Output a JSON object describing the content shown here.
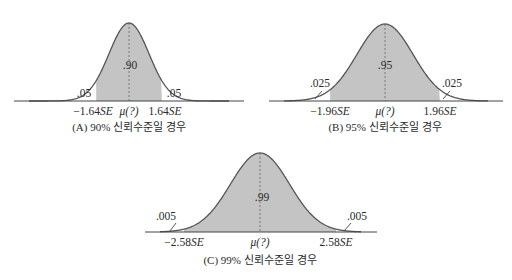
{
  "panels": [
    {
      "id": "A",
      "caption": "(A) 90% 신뢰수준일 경우",
      "center_label": ".90",
      "tail_left_label": ".05",
      "tail_right_label": ".05",
      "tick_left": "−1.64",
      "tick_center": "μ(?)",
      "tick_right": "1.64",
      "se_suffix": "SE",
      "z": 1.64,
      "confidence": 0.9,
      "tail_prob": 0.05
    },
    {
      "id": "B",
      "caption": "(B) 95% 신뢰수준일 경우",
      "center_label": ".95",
      "tail_left_label": ".025",
      "tail_right_label": ".025",
      "tick_left": "−1.96",
      "tick_center": "μ(?)",
      "tick_right": "1.96",
      "se_suffix": "SE",
      "z": 1.96,
      "confidence": 0.95,
      "tail_prob": 0.025
    },
    {
      "id": "C",
      "caption": "(C) 99% 신뢰수준일 경우",
      "center_label": ".99",
      "tail_left_label": ".005",
      "tail_right_label": ".005",
      "tick_left": "−2.58",
      "tick_center": "μ(?)",
      "tick_right": "2.58",
      "se_suffix": "SE",
      "z": 2.58,
      "confidence": 0.99,
      "tail_prob": 0.005
    }
  ],
  "colors": {
    "shade": "#c4c4c4",
    "curve": "#555555",
    "axis": "#444444",
    "text": "#2a2a2a"
  }
}
